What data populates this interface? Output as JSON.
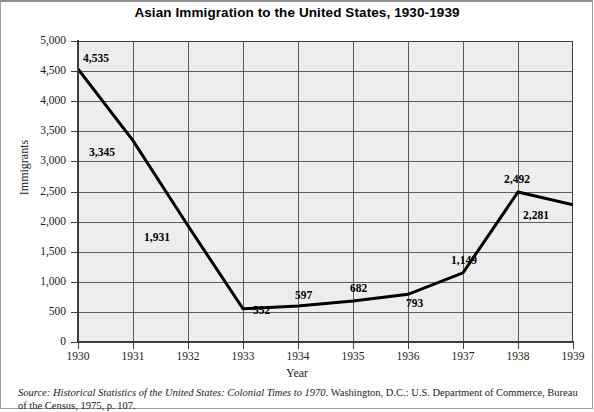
{
  "chart_data": {
    "type": "line",
    "title": "Asian Immigration to the United States, 1930-1939",
    "xlabel": "Year",
    "ylabel": "Immigrants",
    "categories": [
      "1930",
      "1931",
      "1932",
      "1933",
      "1934",
      "1935",
      "1936",
      "1937",
      "1938",
      "1939"
    ],
    "values": [
      4535,
      3345,
      1931,
      552,
      597,
      682,
      793,
      1149,
      2492,
      2281
    ],
    "point_labels": [
      "4,535",
      "3,345",
      "1,931",
      "552",
      "597",
      "682",
      "793",
      "1,149",
      "2,492",
      "2,281"
    ],
    "ylim": [
      0,
      5000
    ],
    "ytick_labels": [
      "5,000",
      "4,500",
      "4,000",
      "3,500",
      "3,000",
      "2,500",
      "2,000",
      "1,500",
      "1,000",
      "500",
      "0"
    ],
    "ytick_values": [
      5000,
      4500,
      4000,
      3500,
      3000,
      2500,
      2000,
      1500,
      1000,
      500,
      0
    ],
    "grid": true,
    "legend": "none",
    "line_color": "#000000",
    "plot_background": "#ededed",
    "gridline_color": "#5c5c5c"
  },
  "source": {
    "prefix": "Source:",
    "work_title": "Historical Statistics of the United States: Colonial Times to 1970",
    "rest": ". Washington, D.C.: U.S. Department of Commerce, Bureau",
    "line2": "of the Census, 1975, p. 107."
  }
}
